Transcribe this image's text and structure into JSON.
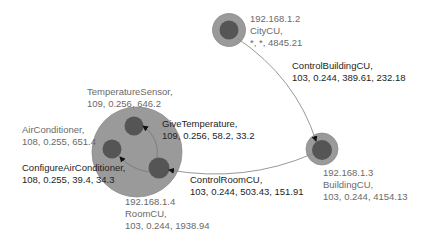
{
  "colors": {
    "outer_circle": "#9a9a9a",
    "outer_stroke": "#8a8a8a",
    "inner_circle": "#555555",
    "edge_line": "#8c8c8c",
    "arrow": "#111111",
    "node_text": "#6a6a6a",
    "edge_text": "#1e1e1e"
  },
  "nodes": {
    "city": {
      "ip": "192.168.1.2",
      "name": "CityCU,",
      "stats": "*, *, 4845.21"
    },
    "building": {
      "ip": "192.168.1.3",
      "name": "BuildingCU,",
      "stats": "103, 0.244, 4154.13"
    },
    "room": {
      "ip": "192.168.1.4",
      "name": "RoomCU,",
      "stats": "103, 0.244, 1938.94"
    },
    "temperature_sensor": {
      "name": "TemperatureSensor,",
      "stats": "109, 0.256, 646.2"
    },
    "air_conditioner": {
      "name": "AirConditioner,",
      "stats": "108, 0.255, 651.4"
    }
  },
  "edges": {
    "control_building": {
      "name": "ControlBuildingCU,",
      "stats": "103, 0.244, 389.61, 232.18"
    },
    "control_room": {
      "name": "ControlRoomCU,",
      "stats": "103, 0.244, 503.43, 151.91"
    },
    "give_temperature": {
      "name": "GiveTemperature,",
      "stats": "109, 0.256, 58.2, 33.2"
    },
    "configure_ac": {
      "name": "ConfigureAirConditioner,",
      "stats": "108, 0.255, 39.4, 34.3"
    }
  }
}
